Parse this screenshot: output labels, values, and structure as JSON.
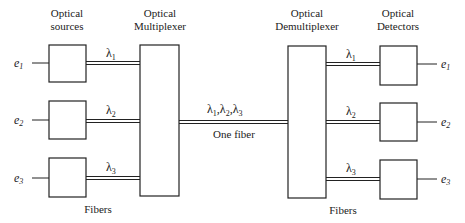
{
  "headings": {
    "sources": [
      "Optical",
      "sources"
    ],
    "multiplexer": [
      "Optical",
      "Multiplexer"
    ],
    "demultiplexer": [
      "Optical",
      "Demultiplexer"
    ],
    "detectors": [
      "Optical",
      "Detectors"
    ]
  },
  "inputs": [
    {
      "sym": "e",
      "sub": "1"
    },
    {
      "sym": "e",
      "sub": "2"
    },
    {
      "sym": "e",
      "sub": "3"
    }
  ],
  "outputs": [
    {
      "sym": "e",
      "sub": "1"
    },
    {
      "sym": "e",
      "sub": "2"
    },
    {
      "sym": "e",
      "sub": "3"
    }
  ],
  "wavelengths": [
    {
      "sym": "λ",
      "sub": "1"
    },
    {
      "sym": "λ",
      "sub": "2"
    },
    {
      "sym": "λ",
      "sub": "3"
    }
  ],
  "trunk": {
    "label_parts": [
      {
        "sym": "λ",
        "sub": "1",
        "sep": ","
      },
      {
        "sym": "λ",
        "sub": "2",
        "sep": ","
      },
      {
        "sym": "λ",
        "sub": "3",
        "sep": ""
      }
    ],
    "caption": "One fiber"
  },
  "fibers_labels": {
    "left": "Fibers",
    "right": "Fibers"
  },
  "colors": {
    "stroke": "#222222",
    "background": "#ffffff"
  }
}
